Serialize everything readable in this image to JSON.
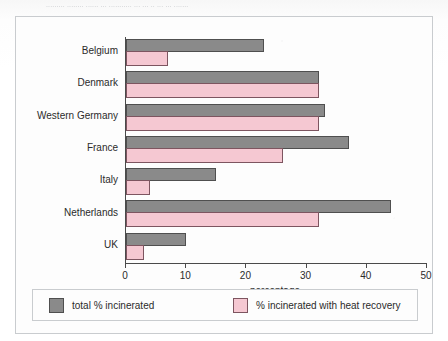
{
  "top_caption": "......... ........ ...... ... ........... ... ... .. ... ... .......",
  "legend": {
    "items": [
      {
        "key": "total",
        "label": "total % incinerated",
        "color": "#8a8a8a"
      },
      {
        "key": "heat",
        "label": "% incinerated with heat recovery",
        "color": "#f5c8d2"
      }
    ]
  },
  "chart_data": {
    "type": "bar",
    "orientation": "horizontal",
    "title": "",
    "xlabel": "percentage",
    "ylabel": "",
    "xlim": [
      0,
      50
    ],
    "xticks": [
      0,
      10,
      20,
      30,
      40,
      50
    ],
    "xticklabels": [
      "0",
      "10",
      "20",
      "30",
      "40",
      "50"
    ],
    "grid": false,
    "legend_position": "bottom",
    "categories": [
      "Belgium",
      "Denmark",
      "Western Germany",
      "France",
      "Italy",
      "Netherlands",
      "UK"
    ],
    "series": [
      {
        "name": "total % incinerated",
        "color": "#8a8a8a",
        "values": [
          23,
          32,
          33,
          37,
          15,
          44,
          10
        ]
      },
      {
        "name": "% incinerated with heat recovery",
        "color": "#f5c8d2",
        "values": [
          7,
          32,
          32,
          26,
          4,
          32,
          3
        ]
      }
    ]
  }
}
